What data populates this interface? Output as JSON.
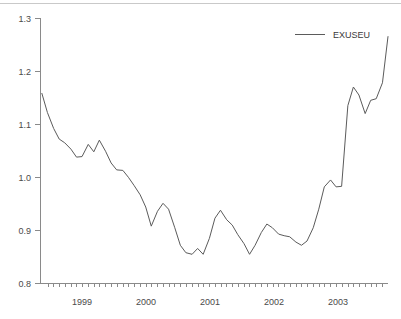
{
  "chart_data": {
    "type": "line",
    "title": "",
    "subtitle": "",
    "xlabel": "",
    "ylabel": "",
    "legend": [
      "EXUSEU"
    ],
    "legend_position": "top-right",
    "grid": false,
    "xlim": [
      1998.6,
      2003.62
    ],
    "ylim": [
      0.8,
      1.3
    ],
    "ytick_labels": [
      "0.8",
      "0.9",
      "1.0",
      "1.1",
      "1.2",
      "1.3"
    ],
    "ytick_values": [
      0.8,
      0.9,
      1.0,
      1.1,
      1.2,
      1.3
    ],
    "xtick_labels": [
      "1999",
      "2000",
      "2001",
      "2002",
      "2003"
    ],
    "xtick_values": [
      1999,
      2000,
      2001,
      2002,
      2003
    ],
    "x_minor_tick_interval": 0.0833,
    "line_color": "#5b5b5b",
    "axis_color": "#8a8a8a",
    "background_color": "#ffffff",
    "series": [
      {
        "name": "EXUSEU",
        "x": [
          1998.62,
          1998.7,
          1998.79,
          1998.87,
          1998.95,
          1999.04,
          1999.12,
          1999.2,
          1999.29,
          1999.37,
          1999.45,
          1999.54,
          1999.62,
          1999.7,
          1999.79,
          1999.87,
          1999.95,
          2000.04,
          2000.12,
          2000.2,
          2000.29,
          2000.37,
          2000.45,
          2000.54,
          2000.62,
          2000.7,
          2000.79,
          2000.87,
          2000.95,
          2001.04,
          2001.12,
          2001.2,
          2001.29,
          2001.37,
          2001.45,
          2001.54,
          2001.62,
          2001.7,
          2001.79,
          2001.87,
          2001.95,
          2002.04,
          2002.12,
          2002.2,
          2002.29,
          2002.37,
          2002.45,
          2002.54,
          2002.62,
          2002.7,
          2002.79,
          2002.87,
          2002.95,
          2003.04,
          2003.12,
          2003.2,
          2003.29,
          2003.37,
          2003.45,
          2003.54,
          2003.62
        ],
        "values": [
          1.158,
          1.122,
          1.092,
          1.072,
          1.065,
          1.053,
          1.038,
          1.039,
          1.062,
          1.048,
          1.07,
          1.049,
          1.027,
          1.014,
          1.013,
          1.0,
          0.985,
          0.967,
          0.944,
          0.908,
          0.936,
          0.951,
          0.94,
          0.905,
          0.872,
          0.858,
          0.855,
          0.866,
          0.855,
          0.885,
          0.923,
          0.938,
          0.92,
          0.91,
          0.892,
          0.875,
          0.855,
          0.872,
          0.896,
          0.912,
          0.905,
          0.893,
          0.89,
          0.888,
          0.878,
          0.872,
          0.88,
          0.905,
          0.94,
          0.982,
          0.995,
          0.982,
          0.983,
          0.985,
          1.01,
          1.04,
          1.072,
          1.078,
          1.088,
          1.092,
          1.135
        ]
      }
    ],
    "series_extended_tail": {
      "x": [
        2003.04,
        2003.12,
        2003.2,
        2003.29,
        2003.37,
        2003.45,
        2003.54,
        2003.62
      ],
      "values": [
        1.135,
        1.17,
        1.155,
        1.12,
        1.145,
        1.148,
        1.178,
        1.265
      ]
    },
    "notes": {
      "series_start_value": 1.158,
      "series_end_value": 1.265,
      "series_min_value": 0.855,
      "series_max_value": 1.265,
      "series_min_period": "2000 / early 2001",
      "series_max_period": "mid 2003"
    }
  },
  "legend": {
    "entry_label": "EXUSEU"
  }
}
